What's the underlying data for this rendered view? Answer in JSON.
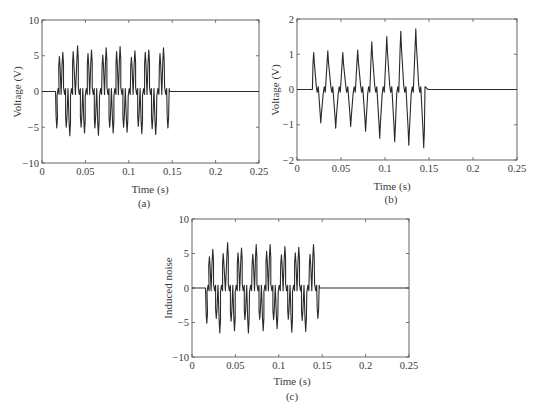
{
  "figure": {
    "panels": [
      "(a)",
      "(b)",
      "(c)"
    ]
  },
  "chart_data": [
    {
      "id": "a",
      "type": "line",
      "caption": "(a)",
      "title": "",
      "xlabel": "Time (s)",
      "ylabel": "Voltage (V)",
      "xlim": [
        0,
        0.25
      ],
      "ylim": [
        -10,
        10
      ],
      "xticks": [
        0,
        0.05,
        0.1,
        0.15,
        0.2,
        0.25
      ],
      "xtick_labels": [
        "0",
        "0.05",
        "0.1",
        "0.15",
        "0.2",
        "0.25"
      ],
      "yticks": [
        -10,
        -5,
        0,
        5,
        10
      ],
      "ytick_labels": [
        "−10",
        "−5",
        "0",
        "5",
        "10"
      ],
      "grid": false,
      "signal_start": 0.015,
      "signal_end": 0.147,
      "cycle_period": 0.0165,
      "series": [
        {
          "name": "Voltage",
          "positive_peaks": [
            [
              0.02,
              4.9
            ],
            [
              0.024,
              5.5
            ],
            [
              0.036,
              5.6
            ],
            [
              0.041,
              6.4
            ],
            [
              0.053,
              5.3
            ],
            [
              0.057,
              5.8
            ],
            [
              0.07,
              5.1
            ],
            [
              0.074,
              6.1
            ],
            [
              0.086,
              5.6
            ],
            [
              0.09,
              6.3
            ],
            [
              0.103,
              4.8
            ],
            [
              0.107,
              5.7
            ],
            [
              0.119,
              5.5
            ],
            [
              0.123,
              5.8
            ],
            [
              0.136,
              5.3
            ],
            [
              0.14,
              6.1
            ]
          ],
          "negative_peaks": [
            [
              0.017,
              -5.1
            ],
            [
              0.028,
              -5.0
            ],
            [
              0.032,
              -6.2
            ],
            [
              0.045,
              -5.0
            ],
            [
              0.049,
              -5.8
            ],
            [
              0.061,
              -5.1
            ],
            [
              0.065,
              -6.1
            ],
            [
              0.078,
              -5.0
            ],
            [
              0.082,
              -5.8
            ],
            [
              0.094,
              -5.0
            ],
            [
              0.098,
              -5.7
            ],
            [
              0.111,
              -4.9
            ],
            [
              0.115,
              -5.9
            ],
            [
              0.127,
              -5.2
            ],
            [
              0.131,
              -6.0
            ],
            [
              0.145,
              -5.1
            ]
          ]
        }
      ]
    },
    {
      "id": "b",
      "type": "line",
      "caption": "(b)",
      "title": "",
      "xlabel": "Time (s)",
      "ylabel": "Voltage (V)",
      "xlim": [
        0,
        0.25
      ],
      "ylim": [
        -2,
        2
      ],
      "xticks": [
        0,
        0.05,
        0.1,
        0.15,
        0.2,
        0.25
      ],
      "xtick_labels": [
        "0",
        "0.05",
        "0.1",
        "0.15",
        "0.2",
        "0.25"
      ],
      "yticks": [
        -2,
        -1,
        0,
        1,
        2
      ],
      "ytick_labels": [
        "−2",
        "−1",
        "0",
        "1",
        "2"
      ],
      "grid": false,
      "signal_start": 0.016,
      "signal_end": 0.149,
      "series": [
        {
          "name": "Voltage",
          "positive_peaks": [
            [
              0.019,
              1.05
            ],
            [
              0.035,
              1.1
            ],
            [
              0.052,
              1.05
            ],
            [
              0.069,
              1.12
            ],
            [
              0.085,
              1.35
            ],
            [
              0.102,
              1.5
            ],
            [
              0.118,
              1.65
            ],
            [
              0.135,
              1.72
            ]
          ],
          "negative_peaks": [
            [
              0.027,
              -0.95
            ],
            [
              0.044,
              -1.1
            ],
            [
              0.061,
              -1.05
            ],
            [
              0.078,
              -1.18
            ],
            [
              0.094,
              -1.38
            ],
            [
              0.111,
              -1.48
            ],
            [
              0.127,
              -1.58
            ],
            [
              0.144,
              -1.65
            ]
          ]
        }
      ]
    },
    {
      "id": "c",
      "type": "line",
      "caption": "(c)",
      "title": "",
      "xlabel": "Time (s)",
      "ylabel": "Induced noise",
      "xlim": [
        0,
        0.25
      ],
      "ylim": [
        -10,
        10
      ],
      "xticks": [
        0,
        0.05,
        0.1,
        0.15,
        0.2,
        0.25
      ],
      "xtick_labels": [
        "0",
        "0.05",
        "0.1",
        "0.15",
        "0.2",
        "0.25"
      ],
      "yticks": [
        -10,
        -5,
        0,
        5,
        10
      ],
      "ytick_labels": [
        "−10",
        "−5",
        "0",
        "5",
        "10"
      ],
      "grid": false,
      "signal_start": 0.015,
      "signal_end": 0.147,
      "series": [
        {
          "name": "Induced noise",
          "positive_peaks": [
            [
              0.02,
              4.5
            ],
            [
              0.024,
              5.6
            ],
            [
              0.036,
              5.0
            ],
            [
              0.041,
              6.6
            ],
            [
              0.053,
              5.1
            ],
            [
              0.057,
              5.8
            ],
            [
              0.07,
              4.9
            ],
            [
              0.074,
              6.3
            ],
            [
              0.086,
              5.3
            ],
            [
              0.09,
              6.3
            ],
            [
              0.103,
              4.8
            ],
            [
              0.107,
              6.0
            ],
            [
              0.119,
              5.1
            ],
            [
              0.123,
              5.9
            ],
            [
              0.136,
              4.9
            ],
            [
              0.14,
              6.3
            ]
          ],
          "negative_peaks": [
            [
              0.017,
              -5.1
            ],
            [
              0.028,
              -4.4
            ],
            [
              0.032,
              -6.5
            ],
            [
              0.045,
              -4.8
            ],
            [
              0.049,
              -6.2
            ],
            [
              0.061,
              -4.6
            ],
            [
              0.065,
              -6.5
            ],
            [
              0.078,
              -4.5
            ],
            [
              0.082,
              -6.2
            ],
            [
              0.094,
              -4.6
            ],
            [
              0.098,
              -5.9
            ],
            [
              0.111,
              -4.5
            ],
            [
              0.115,
              -6.4
            ],
            [
              0.127,
              -4.7
            ],
            [
              0.131,
              -6.3
            ],
            [
              0.145,
              -4.4
            ]
          ]
        }
      ]
    }
  ]
}
